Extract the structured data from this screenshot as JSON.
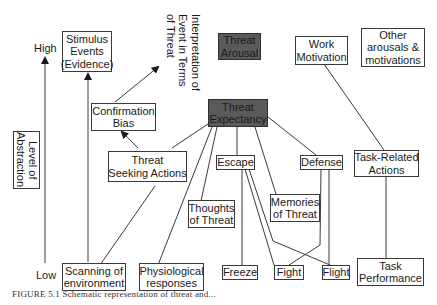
{
  "axis": {
    "high_label": "High",
    "low_label": "Low",
    "title_line1": "Level of",
    "title_line2": "Abstraction"
  },
  "nodes": {
    "stimulus_events": {
      "line1": "Stimulus",
      "line2": "Events",
      "line3": "(Evidence)"
    },
    "interpretation": {
      "line1": "Interpretation of",
      "line2": "Event in Terms",
      "line3": "of Threat"
    },
    "threat_arousal": {
      "line1": "Threat",
      "line2": "Arousal"
    },
    "work_motivation": {
      "line1": "Work",
      "line2": "Motivation"
    },
    "other_arousals": {
      "line1": "Other",
      "line2": "arousals &",
      "line3": "motivations"
    },
    "confirmation_bias": {
      "line1": "Confirmation",
      "line2": "Bias"
    },
    "threat_expectancy": {
      "line1": "Threat",
      "line2": "Expectancy"
    },
    "threat_seeking_actions": {
      "line1": "Threat",
      "line2": "Seeking Actions"
    },
    "escape": {
      "line1": "Escape"
    },
    "defense": {
      "line1": "Defense"
    },
    "task_related_actions": {
      "line1": "Task-Related",
      "line2": "Actions"
    },
    "thoughts_of_threat": {
      "line1": "Thoughts",
      "line2": "of Threat"
    },
    "memories_of_threat": {
      "line1": "Memories",
      "line2": "of Threat"
    },
    "scanning_environment": {
      "line1": "Scanning of",
      "line2": "environment"
    },
    "physiological_responses": {
      "line1": "Physiological",
      "line2": "responses"
    },
    "freeze": {
      "line1": "Freeze"
    },
    "fight": {
      "line1": "Fight"
    },
    "flight": {
      "line1": "Flight"
    },
    "task_performance": {
      "line1": "Task",
      "line2": "Performance"
    }
  },
  "colors": {
    "highlight_fill": "#5a5a5a",
    "line": "#3a3a3a"
  },
  "caption": "FIGURE 5.1 Schematic representation of threat and..."
}
